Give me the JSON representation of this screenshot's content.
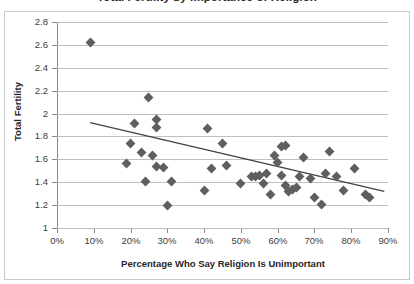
{
  "chart_data": {
    "type": "scatter",
    "title": "Total Fertility by Importance of Religion",
    "xlabel": "Percentage Who Say Religion Is Unimportant",
    "ylabel": "Total Fertility",
    "xlim": [
      0,
      90
    ],
    "ylim": [
      1.0,
      2.8
    ],
    "xticks": [
      0,
      10,
      20,
      30,
      40,
      50,
      60,
      70,
      80,
      90
    ],
    "xtick_labels": [
      "0%",
      "10%",
      "20%",
      "30%",
      "40%",
      "50%",
      "60%",
      "70%",
      "80%",
      "90%"
    ],
    "yticks": [
      1,
      1.2,
      1.4,
      1.6,
      1.8,
      2,
      2.2,
      2.4,
      2.6,
      2.8
    ],
    "ytick_labels": [
      "1",
      "1.2",
      "1.4",
      "1.6",
      "1.8",
      "2",
      "2.2",
      "2.4",
      "2.6",
      "2.8"
    ],
    "grid": "horizontal",
    "legend": null,
    "marker": "diamond",
    "marker_color": "#5f5f5f",
    "trendline": {
      "type": "linear",
      "color": "#404040",
      "x_start": 9,
      "y_start": 1.92,
      "x_end": 89,
      "y_end": 1.32
    },
    "points": [
      {
        "x": 9,
        "y": 2.62
      },
      {
        "x": 19,
        "y": 1.56
      },
      {
        "x": 20,
        "y": 1.74
      },
      {
        "x": 21,
        "y": 1.91
      },
      {
        "x": 23,
        "y": 1.66
      },
      {
        "x": 24,
        "y": 1.41
      },
      {
        "x": 25,
        "y": 2.14
      },
      {
        "x": 26,
        "y": 1.63
      },
      {
        "x": 27,
        "y": 1.54
      },
      {
        "x": 27,
        "y": 1.88
      },
      {
        "x": 27,
        "y": 1.95
      },
      {
        "x": 29,
        "y": 1.53
      },
      {
        "x": 30,
        "y": 1.2
      },
      {
        "x": 31,
        "y": 1.41
      },
      {
        "x": 40,
        "y": 1.33
      },
      {
        "x": 41,
        "y": 1.87
      },
      {
        "x": 42,
        "y": 1.52
      },
      {
        "x": 45,
        "y": 1.74
      },
      {
        "x": 46,
        "y": 1.55
      },
      {
        "x": 50,
        "y": 1.39
      },
      {
        "x": 53,
        "y": 1.45
      },
      {
        "x": 54,
        "y": 1.45
      },
      {
        "x": 55,
        "y": 1.46
      },
      {
        "x": 56,
        "y": 1.39
      },
      {
        "x": 57,
        "y": 1.48
      },
      {
        "x": 58,
        "y": 1.29
      },
      {
        "x": 59,
        "y": 1.63
      },
      {
        "x": 60,
        "y": 1.57
      },
      {
        "x": 61,
        "y": 1.46
      },
      {
        "x": 61,
        "y": 1.71
      },
      {
        "x": 62,
        "y": 1.72
      },
      {
        "x": 62,
        "y": 1.37
      },
      {
        "x": 63,
        "y": 1.32
      },
      {
        "x": 64,
        "y": 1.34
      },
      {
        "x": 65,
        "y": 1.35
      },
      {
        "x": 66,
        "y": 1.45
      },
      {
        "x": 67,
        "y": 1.62
      },
      {
        "x": 69,
        "y": 1.43
      },
      {
        "x": 70,
        "y": 1.27
      },
      {
        "x": 72,
        "y": 1.21
      },
      {
        "x": 73,
        "y": 1.48
      },
      {
        "x": 74,
        "y": 1.67
      },
      {
        "x": 76,
        "y": 1.45
      },
      {
        "x": 78,
        "y": 1.33
      },
      {
        "x": 81,
        "y": 1.52
      },
      {
        "x": 84,
        "y": 1.29
      },
      {
        "x": 85,
        "y": 1.27
      }
    ]
  }
}
